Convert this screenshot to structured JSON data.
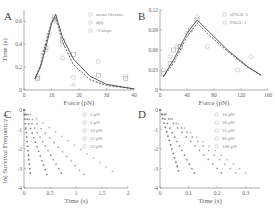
{
  "chart_data": [
    {
      "panel": "A",
      "type": "line",
      "xlabel": "Force (pN)",
      "ylabel": "Time (s)",
      "xlim": [
        0,
        40
      ],
      "ylim": [
        0,
        0.7
      ],
      "xticks": [
        "0",
        "10",
        "20",
        "30",
        "40"
      ],
      "yticks": [
        "0",
        "0.2",
        "0.4",
        "0.6"
      ],
      "legend": [
        "mean lifetime",
        "d(t)",
        "-1/slope"
      ],
      "series": [
        {
          "name": "mean lifetime",
          "marker": "circle",
          "x": [
            5,
            7,
            9,
            11,
            14,
            18,
            27,
            37
          ],
          "y": [
            0.12,
            0.33,
            0.48,
            0.62,
            0.28,
            0.11,
            0.25,
            0.12
          ]
        },
        {
          "name": "d(t)",
          "marker": "square",
          "x": [
            5,
            8,
            11,
            14,
            18,
            27,
            37
          ],
          "y": [
            0.1,
            0.37,
            0.64,
            0.43,
            0.31,
            0.13,
            0.1
          ]
        },
        {
          "name": "-1/slope",
          "marker": "triangle",
          "x": [
            5,
            8,
            11,
            14,
            18
          ],
          "y": [
            0.11,
            0.35,
            0.6,
            0.4,
            0.05
          ]
        },
        {
          "name": "fit solid",
          "x": [
            4,
            6,
            8,
            10,
            11.5,
            14,
            18,
            24,
            30,
            40
          ],
          "y": [
            0.1,
            0.2,
            0.38,
            0.58,
            0.66,
            0.46,
            0.27,
            0.12,
            0.05,
            0.01
          ]
        },
        {
          "name": "fit dashed",
          "x": [
            4,
            6,
            8,
            10,
            11.5,
            14,
            18,
            24,
            30,
            40
          ],
          "y": [
            0.1,
            0.22,
            0.42,
            0.6,
            0.63,
            0.42,
            0.22,
            0.09,
            0.04,
            0.01
          ]
        }
      ]
    },
    {
      "panel": "B",
      "type": "line",
      "xlabel": "Force (pN)",
      "ylabel": "",
      "xlim": [
        0,
        160
      ],
      "ylim": [
        0,
        0.12
      ],
      "xticks": [
        "0",
        "40",
        "80",
        "120",
        "160"
      ],
      "yticks": [
        "0",
        "0.03",
        "0.06",
        "0.09",
        "0.12"
      ],
      "legend": [
        "sPSGL-1",
        "PSGL-1"
      ],
      "series": [
        {
          "name": "sPSGL-1",
          "marker": "circle",
          "x": [
            5,
            15,
            25,
            40,
            55,
            70,
            115,
            135
          ],
          "y": [
            0.03,
            0.05,
            0.065,
            0.085,
            0.11,
            0.065,
            0.03,
            0.05
          ]
        },
        {
          "name": "PSGL-1",
          "marker": "square",
          "x": [
            5,
            15,
            20,
            30,
            45,
            55
          ],
          "y": [
            0.025,
            0.04,
            0.06,
            0.065,
            0.09,
            0.105
          ]
        },
        {
          "name": "fit solid",
          "x": [
            5,
            20,
            40,
            55,
            70,
            100,
            130,
            150
          ],
          "y": [
            0.02,
            0.045,
            0.085,
            0.105,
            0.09,
            0.06,
            0.035,
            0.022
          ]
        },
        {
          "name": "fit dashed",
          "x": [
            5,
            20,
            40,
            55,
            70,
            100,
            130,
            150
          ],
          "y": [
            0.02,
            0.04,
            0.08,
            0.1,
            0.085,
            0.058,
            0.034,
            0.022
          ]
        }
      ]
    },
    {
      "panel": "C",
      "type": "scatter",
      "xlabel": "Time (s)",
      "ylabel": "ln( Survival Frequency )",
      "xlim": [
        0,
        2
      ],
      "ylim": [
        -4,
        0
      ],
      "xticks": [
        "0",
        "0.5",
        "1",
        "1.5",
        "2"
      ],
      "yticks": [
        "-4",
        "-3",
        "-2",
        "-1",
        "0"
      ],
      "legend": [
        "3 pN",
        "5 pN",
        "10 pN",
        "15 pN",
        "20 pN"
      ],
      "series": [
        {
          "name": "3 pN",
          "slope": -1.85,
          "xmax": 1.7
        },
        {
          "name": "5 pN",
          "slope": -2.9,
          "xmax": 1.15
        },
        {
          "name": "10 pN",
          "slope": -4.5,
          "xmax": 0.72
        },
        {
          "name": "15 pN",
          "slope": -7.5,
          "xmax": 0.44
        },
        {
          "name": "20 pN",
          "slope": -27,
          "xmax": 0.12
        }
      ]
    },
    {
      "panel": "D",
      "type": "scatter",
      "xlabel": "Time (s)",
      "ylabel": "",
      "xlim": [
        0,
        0.35
      ],
      "ylim": [
        -4,
        0
      ],
      "xticks": [
        "0",
        "0.1",
        "0.2",
        "0.3"
      ],
      "yticks": [
        "-4",
        "-3",
        "-2",
        "-1",
        "0"
      ],
      "legend": [
        "10 pN",
        "30 pN",
        "55 pN",
        "80 pN",
        "100 pN"
      ],
      "series": [
        {
          "name": "10 pN",
          "slope": -10.8,
          "xmax": 0.3
        },
        {
          "name": "30 pN",
          "slope": -12.2,
          "xmax": 0.265
        },
        {
          "name": "55 pN",
          "slope": -15,
          "xmax": 0.215
        },
        {
          "name": "80 pN",
          "slope": -27,
          "xmax": 0.12
        },
        {
          "name": "100 pN",
          "slope": -48,
          "xmax": 0.065
        }
      ]
    }
  ],
  "panels": {
    "A": {
      "label": "A"
    },
    "B": {
      "label": "B"
    },
    "C": {
      "label": "C"
    },
    "D": {
      "label": "D"
    }
  }
}
